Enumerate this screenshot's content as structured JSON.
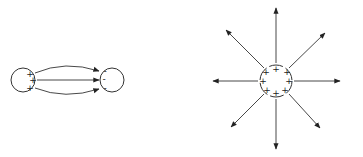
{
  "figure": {
    "left_diagram": {
      "description": "Electric field lines between a positive and negative charge",
      "positive_body": {
        "cx": 23,
        "cy": 80,
        "r": 12,
        "charges": [
          "+",
          "+",
          "+"
        ]
      },
      "negative_body": {
        "cx": 112,
        "cy": 80,
        "r": 12,
        "charges": [
          "-",
          "-",
          "-"
        ]
      },
      "field_lines": 3
    },
    "right_diagram": {
      "description": "Radial electric field lines from an isolated positive charge",
      "body": {
        "cx": 276,
        "cy": 81,
        "r": 16,
        "charges": [
          "+",
          "+",
          "+",
          "+",
          "+",
          "+",
          "+",
          "+"
        ]
      },
      "field_lines": 8
    },
    "colors": {
      "line": "#222222",
      "background": "#ffffff"
    }
  }
}
